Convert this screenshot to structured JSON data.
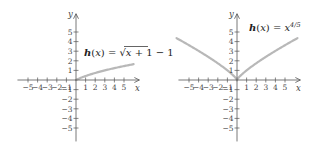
{
  "chart_data": [
    {
      "type": "line",
      "title": "h(x) = √(x + 1) − 1",
      "function": "sqrt(x+1)-1",
      "xlabel": "x",
      "ylabel": "y",
      "xlim": [
        -6,
        6
      ],
      "ylim": [
        -6,
        6
      ],
      "x_ticks": [
        "-5",
        "-4",
        "-3",
        "-2",
        "-1",
        "1",
        "2",
        "3",
        "4",
        "5"
      ],
      "y_ticks": [
        "5",
        "4",
        "3",
        "2",
        "1",
        "-1",
        "-2",
        "-3",
        "-4",
        "-5"
      ],
      "grid": false,
      "series": [
        {
          "name": "h(x) = √(x + 1) − 1",
          "x": [
            0,
            1,
            2,
            3,
            4,
            5,
            6
          ],
          "y": [
            0,
            0.41,
            0.73,
            1.0,
            1.24,
            1.45,
            1.65
          ]
        }
      ]
    },
    {
      "type": "line",
      "title": "h(x) = x^(4/5)",
      "function": "x^(4/5)",
      "xlabel": "x",
      "ylabel": "y",
      "xlim": [
        -6,
        6
      ],
      "ylim": [
        -6,
        6
      ],
      "x_ticks": [
        "-5",
        "-4",
        "-3",
        "-2",
        "-1",
        "1",
        "2",
        "3",
        "4",
        "5"
      ],
      "y_ticks": [
        "5",
        "4",
        "3",
        "2",
        "1",
        "-1",
        "-2",
        "-3",
        "-4",
        "-5"
      ],
      "grid": false,
      "series": [
        {
          "name": "h(x) = x^(4/5)",
          "x": [
            -6.3,
            -5,
            -4,
            -3,
            -2,
            -1,
            0,
            1,
            2,
            3,
            4,
            5,
            6.3
          ],
          "y": [
            4.36,
            3.62,
            3.03,
            2.41,
            1.74,
            1.0,
            0,
            1.0,
            1.74,
            2.41,
            3.03,
            3.62,
            4.36
          ]
        }
      ]
    }
  ],
  "charts": {
    "left": {
      "label_h": "h",
      "label_paren_x": "(x)",
      "label_eq": " = ",
      "label_radicand": "x + 1",
      "label_tail": " − 1"
    },
    "right": {
      "label_h": "h",
      "label_paren_x": "(x)",
      "label_eq": " = ",
      "label_base": "x",
      "label_exp": "4/5"
    },
    "axis_x": "x",
    "axis_y": "y"
  },
  "colors": {
    "curve": "#b8b8b8",
    "axis": "#555555",
    "text": "#222222"
  }
}
